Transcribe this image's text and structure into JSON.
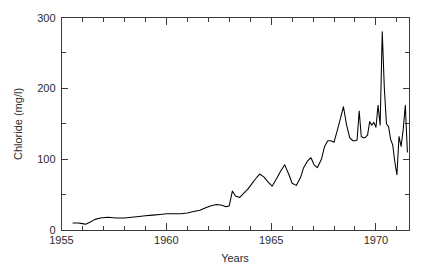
{
  "chart_data": {
    "type": "line",
    "title": "",
    "xlabel": "Years",
    "ylabel": "Chloride (mg/l)",
    "xlim": [
      1955,
      1971.6
    ],
    "ylim": [
      0,
      300
    ],
    "grid": false,
    "legend": null,
    "x_major_ticks": [
      1955,
      1960,
      1965,
      1970
    ],
    "x_major_tick_labels": [
      "1955",
      "1960",
      "1965",
      "1970"
    ],
    "x_minor_ticks": [
      1956,
      1957,
      1958,
      1959,
      1961,
      1962,
      1963,
      1964,
      1966,
      1967,
      1968,
      1969,
      1971
    ],
    "y_major_ticks": [
      0,
      100,
      200,
      300
    ],
    "y_major_tick_labels": [
      "0",
      "100",
      "200",
      "300"
    ],
    "y_minor_ticks": [
      50,
      150,
      250
    ],
    "series": [
      {
        "name": "Chloride",
        "color": "#000000",
        "x": [
          1955.55,
          1955.8,
          1956.0,
          1956.15,
          1956.35,
          1956.6,
          1956.85,
          1957.2,
          1957.6,
          1958.0,
          1958.35,
          1958.7,
          1959.0,
          1959.35,
          1959.7,
          1960.0,
          1960.35,
          1960.7,
          1961.0,
          1961.3,
          1961.6,
          1961.85,
          1962.1,
          1962.4,
          1962.65,
          1962.85,
          1963.0,
          1963.15,
          1963.3,
          1963.5,
          1963.7,
          1963.9,
          1964.05,
          1964.25,
          1964.45,
          1964.65,
          1964.85,
          1965.05,
          1965.25,
          1965.45,
          1965.65,
          1965.85,
          1966.0,
          1966.2,
          1966.4,
          1966.55,
          1966.75,
          1966.9,
          1967.05,
          1967.2,
          1967.4,
          1967.55,
          1967.7,
          1967.85,
          1968.0,
          1968.15,
          1968.3,
          1968.45,
          1968.6,
          1968.75,
          1968.9,
          1969.0,
          1969.1,
          1969.2,
          1969.3,
          1969.4,
          1969.5,
          1969.6,
          1969.7,
          1969.8,
          1969.9,
          1970.0,
          1970.1,
          1970.2,
          1970.3,
          1970.4,
          1970.5,
          1970.6,
          1970.7,
          1970.8,
          1970.9,
          1971.0,
          1971.1,
          1971.2,
          1971.3,
          1971.4,
          1971.5
        ],
        "y": [
          10,
          10,
          9,
          8,
          11,
          15,
          17,
          18,
          17,
          17,
          18,
          19,
          20,
          21,
          22,
          23,
          23,
          23,
          24,
          26,
          28,
          31,
          34,
          36,
          35,
          33,
          34,
          55,
          48,
          46,
          52,
          58,
          64,
          72,
          79,
          75,
          68,
          62,
          72,
          83,
          92,
          78,
          66,
          63,
          74,
          88,
          98,
          102,
          92,
          88,
          100,
          118,
          126,
          126,
          124,
          140,
          157,
          174,
          148,
          130,
          126,
          126,
          127,
          168,
          132,
          130,
          131,
          134,
          153,
          148,
          152,
          145,
          176,
          148,
          280,
          200,
          150,
          146,
          128,
          120,
          96,
          78,
          132,
          118,
          142,
          176,
          110
        ]
      }
    ]
  }
}
